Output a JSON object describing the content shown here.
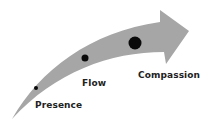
{
  "diagram": {
    "arrow_color": "#a6a6a6",
    "dot_color": "#0a0a0a",
    "stages": [
      {
        "label": "Presence",
        "dot_size": "small"
      },
      {
        "label": "Flow",
        "dot_size": "medium"
      },
      {
        "label": "Compassion",
        "dot_size": "large"
      }
    ]
  }
}
